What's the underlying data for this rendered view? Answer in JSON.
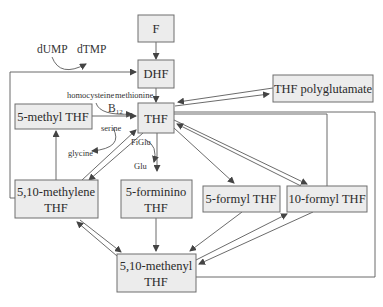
{
  "diagram": {
    "nodes": {
      "F": {
        "label": "F"
      },
      "DHF": {
        "label": "DHF"
      },
      "THF": {
        "label": "THF"
      },
      "THF_poly": {
        "label": "THF polyglutamate"
      },
      "methyl": {
        "label": "5-methyl THF"
      },
      "methylene": {
        "line1": "5,10-methylene",
        "line2": "THF"
      },
      "forminino": {
        "line1": "5-forminino",
        "line2": "THF"
      },
      "formyl5": {
        "label": "5-formyl THF"
      },
      "formyl10": {
        "label": "10-formyl THF"
      },
      "methenyl": {
        "line1": "5,10-methenyl",
        "line2": "THF"
      }
    },
    "labels": {
      "dUMP": "dUMP",
      "dTMP": "dTMP",
      "homocysteine": "homocysteine",
      "methionine": "methionine",
      "B12": "B",
      "B12_sub": "12",
      "serine": "serine",
      "glycine": "glycine",
      "FiGlu": "FiGlu",
      "Glu": "Glu"
    },
    "edges": [
      {
        "from": "F",
        "to": "DHF"
      },
      {
        "from": "DHF",
        "to": "THF",
        "note": "homocysteine → methionine"
      },
      {
        "from": "5-methyl THF",
        "to": "THF",
        "cofactor": "B12"
      },
      {
        "from": "THF",
        "to": "THF polyglutamate",
        "bidirectional": true
      },
      {
        "from": "THF",
        "to": "5,10-methylene THF",
        "bidirectional": true,
        "note": "serine → glycine"
      },
      {
        "from": "5,10-methylene THF",
        "to": "5-methyl THF"
      },
      {
        "from": "5,10-methylene THF",
        "to": "DHF",
        "note": "dUMP → dTMP"
      },
      {
        "from": "THF",
        "to": "5-forminino THF",
        "note": "FiGlu → Glu"
      },
      {
        "from": "THF",
        "to": "5-formyl THF"
      },
      {
        "from": "THF",
        "to": "10-formyl THF",
        "bidirectional": true
      },
      {
        "from": "5,10-methylene THF",
        "to": "5,10-methenyl THF",
        "bidirectional": true
      },
      {
        "from": "5-forminino THF",
        "to": "5,10-methenyl THF"
      },
      {
        "from": "5-formyl THF",
        "to": "5,10-methenyl THF"
      },
      {
        "from": "10-formyl THF",
        "to": "5,10-methenyl THF",
        "bidirectional": true
      },
      {
        "from": "THF",
        "to": "10-formyl THF",
        "route": "loop-right-inner"
      },
      {
        "from": "THF",
        "to": "5,10-methenyl THF",
        "route": "loop-right-outer"
      }
    ]
  },
  "colors": {
    "box_fill": "#ececec",
    "box_stroke": "#6e6e6e",
    "line": "#5a5a5a",
    "text": "#2a2a2a"
  }
}
